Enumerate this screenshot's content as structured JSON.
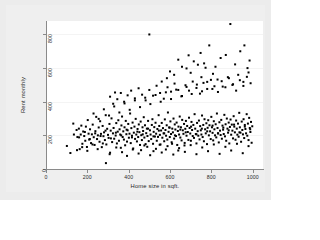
{
  "chart_data": {
    "type": "scatter",
    "title": "",
    "xlabel": "Home size in sqft.",
    "ylabel": "Rent monthly",
    "xlim": [
      0,
      1050
    ],
    "ylim": [
      0,
      880
    ],
    "xticks": [
      0,
      200,
      400,
      600,
      800,
      1000
    ],
    "yticks": [
      0,
      200,
      400,
      600,
      800
    ],
    "xticklabels": [
      "0",
      "200",
      "400",
      "600",
      "800",
      "1000"
    ],
    "yticklabels": [
      "0",
      "200",
      "400",
      "600",
      "800"
    ],
    "grid": "horizontal-faint",
    "legend": "none",
    "marker": {
      "shape": "square",
      "color": "#000000",
      "size": 2
    },
    "n_points": 404,
    "points": [
      [
        101,
        137
      ],
      [
        118,
        95
      ],
      [
        132,
        270
      ],
      [
        148,
        232
      ],
      [
        152,
        190
      ],
      [
        159,
        240
      ],
      [
        163,
        118
      ],
      [
        168,
        205
      ],
      [
        171,
        258
      ],
      [
        176,
        150
      ],
      [
        180,
        223
      ],
      [
        185,
        196
      ],
      [
        190,
        168
      ],
      [
        193,
        252
      ],
      [
        198,
        131
      ],
      [
        202,
        291
      ],
      [
        206,
        210
      ],
      [
        209,
        175
      ],
      [
        213,
        236
      ],
      [
        218,
        154
      ],
      [
        222,
        206
      ],
      [
        226,
        264
      ],
      [
        231,
        189
      ],
      [
        235,
        143
      ],
      [
        239,
        225
      ],
      [
        243,
        310
      ],
      [
        247,
        178
      ],
      [
        251,
        200
      ],
      [
        255,
        247
      ],
      [
        259,
        162
      ],
      [
        262,
        284
      ],
      [
        266,
        209
      ],
      [
        270,
        130
      ],
      [
        274,
        256
      ],
      [
        278,
        195
      ],
      [
        281,
        218
      ],
      [
        285,
        172
      ],
      [
        289,
        320
      ],
      [
        292,
        146
      ],
      [
        296,
        239
      ],
      [
        300,
        203
      ],
      [
        303,
        185
      ],
      [
        307,
        268
      ],
      [
        310,
        97
      ],
      [
        313,
        228
      ],
      [
        317,
        301
      ],
      [
        320,
        160
      ],
      [
        324,
        212
      ],
      [
        327,
        244
      ],
      [
        330,
        180
      ],
      [
        334,
        455
      ],
      [
        337,
        199
      ],
      [
        340,
        273
      ],
      [
        343,
        152
      ],
      [
        347,
        222
      ],
      [
        350,
        290
      ],
      [
        353,
        168
      ],
      [
        356,
        236
      ],
      [
        359,
        205
      ],
      [
        362,
        126
      ],
      [
        365,
        259
      ],
      [
        368,
        312
      ],
      [
        371,
        190
      ],
      [
        374,
        224
      ],
      [
        377,
        175
      ],
      [
        380,
        248
      ],
      [
        383,
        141
      ],
      [
        386,
        286
      ],
      [
        389,
        207
      ],
      [
        392,
        163
      ],
      [
        395,
        230
      ],
      [
        398,
        268
      ],
      [
        401,
        186
      ],
      [
        404,
        210
      ],
      [
        407,
        330
      ],
      [
        410,
        154
      ],
      [
        413,
        243
      ],
      [
        416,
        198
      ],
      [
        419,
        276
      ],
      [
        422,
        122
      ],
      [
        425,
        216
      ],
      [
        428,
        252
      ],
      [
        431,
        179
      ],
      [
        434,
        298
      ],
      [
        437,
        205
      ],
      [
        440,
        164
      ],
      [
        443,
        238
      ],
      [
        446,
        190
      ],
      [
        449,
        265
      ],
      [
        452,
        219
      ],
      [
        455,
        143
      ],
      [
        458,
        282
      ],
      [
        461,
        201
      ],
      [
        464,
        172
      ],
      [
        467,
        248
      ],
      [
        470,
        226
      ],
      [
        473,
        308
      ],
      [
        476,
        187
      ],
      [
        479,
        260
      ],
      [
        482,
        148
      ],
      [
        485,
        213
      ],
      [
        488,
        240
      ],
      [
        491,
        196
      ],
      [
        494,
        286
      ],
      [
        497,
        166
      ],
      [
        500,
        800
      ],
      [
        503,
        230
      ],
      [
        506,
        205
      ],
      [
        509,
        178
      ],
      [
        512,
        262
      ],
      [
        515,
        296
      ],
      [
        518,
        150
      ],
      [
        521,
        221
      ],
      [
        524,
        249
      ],
      [
        527,
        193
      ],
      [
        530,
        275
      ],
      [
        533,
        210
      ],
      [
        536,
        168
      ],
      [
        539,
        238
      ],
      [
        542,
        191
      ],
      [
        545,
        320
      ],
      [
        548,
        256
      ],
      [
        551,
        203
      ],
      [
        554,
        146
      ],
      [
        557,
        229
      ],
      [
        560,
        274
      ],
      [
        563,
        186
      ],
      [
        566,
        243
      ],
      [
        569,
        212
      ],
      [
        572,
        165
      ],
      [
        575,
        295
      ],
      [
        578,
        232
      ],
      [
        581,
        198
      ],
      [
        584,
        260
      ],
      [
        587,
        175
      ],
      [
        590,
        336
      ],
      [
        593,
        221
      ],
      [
        596,
        247
      ],
      [
        599,
        190
      ],
      [
        602,
        283
      ],
      [
        605,
        208
      ],
      [
        608,
        159
      ],
      [
        611,
        240
      ],
      [
        614,
        218
      ],
      [
        617,
        300
      ],
      [
        620,
        181
      ],
      [
        623,
        265
      ],
      [
        626,
        235
      ],
      [
        629,
        196
      ],
      [
        632,
        276
      ],
      [
        635,
        143
      ],
      [
        638,
        226
      ],
      [
        641,
        252
      ],
      [
        644,
        205
      ],
      [
        647,
        312
      ],
      [
        650,
        187
      ],
      [
        653,
        248
      ],
      [
        656,
        170
      ],
      [
        659,
        292
      ],
      [
        662,
        230
      ],
      [
        665,
        209
      ],
      [
        668,
        268
      ],
      [
        671,
        155
      ],
      [
        674,
        239
      ],
      [
        677,
        286
      ],
      [
        680,
        198
      ],
      [
        683,
        256
      ],
      [
        686,
        220
      ],
      [
        689,
        173
      ],
      [
        692,
        305
      ],
      [
        695,
        244
      ],
      [
        698,
        211
      ],
      [
        701,
        168
      ],
      [
        704,
        280
      ],
      [
        707,
        232
      ],
      [
        710,
        196
      ],
      [
        713,
        262
      ],
      [
        716,
        185
      ],
      [
        719,
        326
      ],
      [
        722,
        240
      ],
      [
        725,
        208
      ],
      [
        728,
        152
      ],
      [
        731,
        274
      ],
      [
        734,
        225
      ],
      [
        737,
        198
      ],
      [
        740,
        288
      ],
      [
        743,
        176
      ],
      [
        746,
        255
      ],
      [
        749,
        230
      ],
      [
        752,
        205
      ],
      [
        755,
        318
      ],
      [
        758,
        190
      ],
      [
        761,
        262
      ],
      [
        764,
        165
      ],
      [
        767,
        296
      ],
      [
        770,
        236
      ],
      [
        773,
        212
      ],
      [
        776,
        272
      ],
      [
        779,
        148
      ],
      [
        782,
        245
      ],
      [
        785,
        290
      ],
      [
        788,
        200
      ],
      [
        791,
        260
      ],
      [
        794,
        224
      ],
      [
        797,
        178
      ],
      [
        800,
        310
      ],
      [
        803,
        248
      ],
      [
        806,
        215
      ],
      [
        809,
        170
      ],
      [
        812,
        284
      ],
      [
        815,
        236
      ],
      [
        818,
        200
      ],
      [
        821,
        266
      ],
      [
        824,
        188
      ],
      [
        827,
        330
      ],
      [
        830,
        244
      ],
      [
        833,
        212
      ],
      [
        836,
        158
      ],
      [
        839,
        278
      ],
      [
        842,
        228
      ],
      [
        845,
        202
      ],
      [
        848,
        292
      ],
      [
        851,
        180
      ],
      [
        854,
        258
      ],
      [
        857,
        234
      ],
      [
        860,
        208
      ],
      [
        863,
        322
      ],
      [
        866,
        194
      ],
      [
        869,
        266
      ],
      [
        872,
        168
      ],
      [
        875,
        300
      ],
      [
        878,
        240
      ],
      [
        881,
        216
      ],
      [
        884,
        276
      ],
      [
        887,
        152
      ],
      [
        890,
        250
      ],
      [
        893,
        294
      ],
      [
        896,
        204
      ],
      [
        899,
        264
      ],
      [
        902,
        228
      ],
      [
        905,
        182
      ],
      [
        908,
        314
      ],
      [
        911,
        252
      ],
      [
        914,
        218
      ],
      [
        917,
        174
      ],
      [
        920,
        288
      ],
      [
        923,
        240
      ],
      [
        926,
        204
      ],
      [
        929,
        270
      ],
      [
        932,
        192
      ],
      [
        935,
        334
      ],
      [
        938,
        248
      ],
      [
        941,
        216
      ],
      [
        944,
        162
      ],
      [
        947,
        282
      ],
      [
        950,
        232
      ],
      [
        953,
        206
      ],
      [
        956,
        296
      ],
      [
        959,
        184
      ],
      [
        962,
        262
      ],
      [
        965,
        238
      ],
      [
        968,
        212
      ],
      [
        971,
        326
      ],
      [
        974,
        198
      ],
      [
        977,
        270
      ],
      [
        980,
        172
      ],
      [
        983,
        304
      ],
      [
        986,
        244
      ],
      [
        989,
        220
      ],
      [
        992,
        280
      ],
      [
        995,
        156
      ],
      [
        998,
        254
      ],
      [
        310,
        430
      ],
      [
        325,
        388
      ],
      [
        345,
        415
      ],
      [
        362,
        452
      ],
      [
        378,
        400
      ],
      [
        395,
        438
      ],
      [
        412,
        466
      ],
      [
        430,
        420
      ],
      [
        448,
        480
      ],
      [
        465,
        442
      ],
      [
        482,
        408
      ],
      [
        500,
        470
      ],
      [
        518,
        436
      ],
      [
        535,
        495
      ],
      [
        552,
        452
      ],
      [
        570,
        418
      ],
      [
        588,
        486
      ],
      [
        605,
        460
      ],
      [
        622,
        508
      ],
      [
        640,
        470
      ],
      [
        658,
        434
      ],
      [
        675,
        498
      ],
      [
        692,
        466
      ],
      [
        710,
        520
      ],
      [
        728,
        482
      ],
      [
        745,
        448
      ],
      [
        762,
        512
      ],
      [
        780,
        476
      ],
      [
        798,
        530
      ],
      [
        815,
        492
      ],
      [
        832,
        458
      ],
      [
        850,
        522
      ],
      [
        868,
        486
      ],
      [
        885,
        540
      ],
      [
        902,
        500
      ],
      [
        920,
        466
      ],
      [
        938,
        528
      ],
      [
        955,
        494
      ],
      [
        972,
        548
      ],
      [
        990,
        510
      ],
      [
        230,
        330
      ],
      [
        255,
        298
      ],
      [
        280,
        355
      ],
      [
        305,
        318
      ],
      [
        330,
        372
      ],
      [
        355,
        336
      ],
      [
        380,
        390
      ],
      [
        405,
        352
      ],
      [
        430,
        408
      ],
      [
        455,
        368
      ],
      [
        480,
        424
      ],
      [
        505,
        386
      ],
      [
        530,
        440
      ],
      [
        555,
        400
      ],
      [
        580,
        456
      ],
      [
        605,
        416
      ],
      [
        630,
        472
      ],
      [
        655,
        432
      ],
      [
        680,
        488
      ],
      [
        705,
        446
      ],
      [
        730,
        502
      ],
      [
        755,
        462
      ],
      [
        780,
        518
      ],
      [
        805,
        476
      ],
      [
        830,
        532
      ],
      [
        855,
        490
      ],
      [
        880,
        546
      ],
      [
        905,
        504
      ],
      [
        930,
        560
      ],
      [
        955,
        518
      ],
      [
        980,
        574
      ],
      [
        640,
        650
      ],
      [
        658,
        608
      ],
      [
        690,
        676
      ],
      [
        715,
        640
      ],
      [
        748,
        690
      ],
      [
        765,
        628
      ],
      [
        790,
        735
      ],
      [
        820,
        608
      ],
      [
        845,
        660
      ],
      [
        870,
        678
      ],
      [
        892,
        862
      ],
      [
        915,
        622
      ],
      [
        940,
        700
      ],
      [
        960,
        735
      ],
      [
        975,
        600
      ],
      [
        985,
        645
      ],
      [
        600,
        580
      ],
      [
        620,
        560
      ],
      [
        680,
        598
      ],
      [
        700,
        572
      ],
      [
        735,
        620
      ],
      [
        752,
        546
      ],
      [
        772,
        602
      ],
      [
        808,
        566
      ],
      [
        560,
        520
      ],
      [
        585,
        540
      ],
      [
        290,
        35
      ],
      [
        308,
        88
      ],
      [
        340,
        128
      ],
      [
        368,
        100
      ],
      [
        392,
        78
      ],
      [
        420,
        116
      ],
      [
        448,
        92
      ],
      [
        476,
        140
      ],
      [
        504,
        82
      ],
      [
        532,
        120
      ],
      [
        560,
        98
      ],
      [
        588,
        136
      ],
      [
        616,
        86
      ],
      [
        644,
        124
      ],
      [
        672,
        102
      ],
      [
        700,
        142
      ],
      [
        728,
        88
      ],
      [
        756,
        128
      ],
      [
        784,
        106
      ],
      [
        812,
        146
      ],
      [
        840,
        90
      ],
      [
        868,
        132
      ],
      [
        896,
        110
      ],
      [
        924,
        150
      ],
      [
        952,
        94
      ],
      [
        980,
        136
      ],
      [
        150,
        112
      ],
      [
        175,
        130
      ],
      [
        200,
        108
      ],
      [
        225,
        146
      ],
      [
        250,
        118
      ],
      [
        275,
        152
      ],
      [
        460,
        112
      ],
      [
        490,
        132
      ],
      [
        520,
        106
      ],
      [
        550,
        144
      ],
      [
        580,
        116
      ],
      [
        610,
        150
      ],
      [
        640,
        110
      ],
      [
        670,
        140
      ],
      [
        135,
        205
      ],
      [
        160,
        188
      ],
      [
        188,
        220
      ],
      [
        212,
        178
      ],
      [
        238,
        212
      ],
      [
        264,
        196
      ],
      [
        288,
        228
      ],
      [
        314,
        182
      ],
      [
        338,
        216
      ],
      [
        364,
        200
      ],
      [
        390,
        234
      ],
      [
        416,
        188
      ],
      [
        442,
        222
      ],
      [
        468,
        206
      ],
      [
        494,
        240
      ],
      [
        520,
        194
      ],
      [
        546,
        228
      ],
      [
        572,
        212
      ],
      [
        598,
        246
      ],
      [
        624,
        200
      ],
      [
        650,
        234
      ],
      [
        676,
        218
      ],
      [
        702,
        252
      ],
      [
        728,
        206
      ],
      [
        754,
        240
      ],
      [
        780,
        224
      ],
      [
        806,
        258
      ],
      [
        832,
        212
      ],
      [
        858,
        246
      ],
      [
        884,
        230
      ],
      [
        910,
        264
      ],
      [
        936,
        218
      ],
      [
        962,
        252
      ],
      [
        988,
        236
      ]
    ]
  }
}
